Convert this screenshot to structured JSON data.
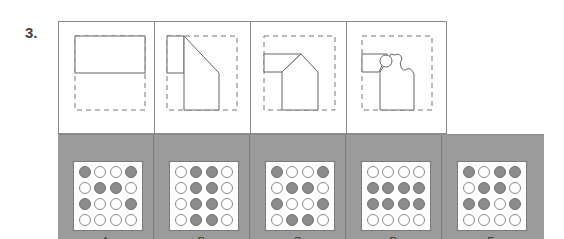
{
  "question": {
    "number": "3."
  },
  "sequence_panels": [
    {
      "id": "panel-1",
      "shape": "rectangle-split"
    },
    {
      "id": "panel-2",
      "shape": "tab-with-diagonal"
    },
    {
      "id": "panel-3",
      "shape": "tab-with-pentagon"
    },
    {
      "id": "panel-4",
      "shape": "tab-with-circle-bumps"
    }
  ],
  "options": [
    {
      "label": "A",
      "grid": [
        [
          "f",
          "o",
          "o",
          "f"
        ],
        [
          "o",
          "f",
          "f",
          "o"
        ],
        [
          "f",
          "o",
          "o",
          "f"
        ],
        [
          "o",
          "o",
          "o",
          "o"
        ]
      ]
    },
    {
      "label": "B",
      "grid": [
        [
          "o",
          "f",
          "f",
          "o"
        ],
        [
          "o",
          "f",
          "f",
          "o"
        ],
        [
          "o",
          "f",
          "f",
          "o"
        ],
        [
          "o",
          "f",
          "f",
          "o"
        ]
      ]
    },
    {
      "label": "C",
      "grid": [
        [
          "f",
          "o",
          "o",
          "f"
        ],
        [
          "o",
          "f",
          "f",
          "o"
        ],
        [
          "f",
          "o",
          "o",
          "f"
        ],
        [
          "o",
          "f",
          "f",
          "o"
        ]
      ]
    },
    {
      "label": "D",
      "grid": [
        [
          "o",
          "o",
          "o",
          "o"
        ],
        [
          "f",
          "f",
          "f",
          "f"
        ],
        [
          "f",
          "f",
          "f",
          "f"
        ],
        [
          "o",
          "o",
          "o",
          "o"
        ]
      ]
    },
    {
      "label": "E",
      "grid": [
        [
          "f",
          "o",
          "f",
          "f"
        ],
        [
          "o",
          "f",
          "f",
          "o"
        ],
        [
          "f",
          "f",
          "o",
          "f"
        ],
        [
          "o",
          "o",
          "o",
          "o"
        ]
      ]
    }
  ],
  "colors": {
    "option_background": "#9b9b9b",
    "filled_dot": "#8c8c8c",
    "open_dot": "#ffffff",
    "line": "#666666"
  }
}
